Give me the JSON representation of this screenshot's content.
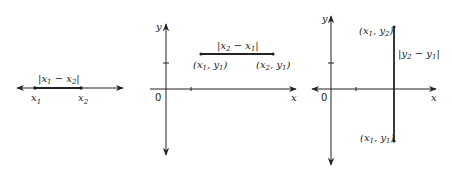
{
  "colors": {
    "ink": "#222222",
    "background": "#ffffff"
  },
  "panels": [
    {
      "id": "number-line",
      "distance_label": "|x1 − x2|",
      "points": [
        {
          "name": "x",
          "sub": "1"
        },
        {
          "name": "x",
          "sub": "2"
        }
      ]
    },
    {
      "id": "horizontal-segment",
      "axis_x": "x",
      "axis_y": "y",
      "origin": "0",
      "distance_label": {
        "open": "|",
        "a": "x",
        "a_sub": "2",
        "minus": " − ",
        "b": "x",
        "b_sub": "1",
        "close": "|"
      },
      "points": [
        {
          "label_open": "(",
          "x": "x",
          "x_sub": "1",
          "comma": ", ",
          "y": "y",
          "y_sub": "1",
          "close": ")"
        },
        {
          "label_open": "(",
          "x": "x",
          "x_sub": "2",
          "comma": ", ",
          "y": "y",
          "y_sub": "1",
          "close": ")"
        }
      ]
    },
    {
      "id": "vertical-segment",
      "axis_x": "x",
      "axis_y": "y",
      "origin": "0",
      "distance_label": {
        "open": "|",
        "a": "y",
        "a_sub": "2",
        "minus": " − ",
        "b": "y",
        "b_sub": "1",
        "close": "|"
      },
      "points": [
        {
          "label_open": "(",
          "x": "x",
          "x_sub": "1",
          "comma": ", ",
          "y": "y",
          "y_sub": "2",
          "close": ")"
        },
        {
          "label_open": "(",
          "x": "x",
          "x_sub": "1",
          "comma": ", ",
          "y": "y",
          "y_sub": "1",
          "close": ")"
        }
      ]
    }
  ],
  "left_label": {
    "open": "|",
    "a": "x",
    "a_sub": "1",
    "minus": " − ",
    "b": "x",
    "b_sub": "2",
    "close": "|"
  }
}
